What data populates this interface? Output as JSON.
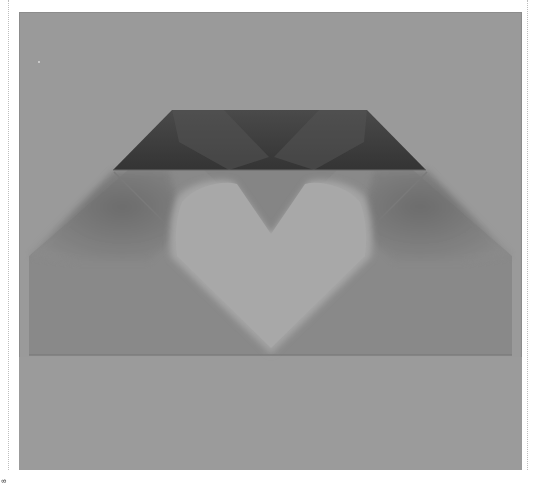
{
  "image": {
    "subject": "Grayscale photograph of a folded paper envelope with a heart-shaped window",
    "palette": {
      "background": "#9a9a9a",
      "top_flap_dark": "#3e3e3e",
      "heart": "#aaaaaa",
      "envelope_body": "#8a8a8a",
      "page_margin": "#ffffff"
    },
    "side_caption": "8"
  }
}
